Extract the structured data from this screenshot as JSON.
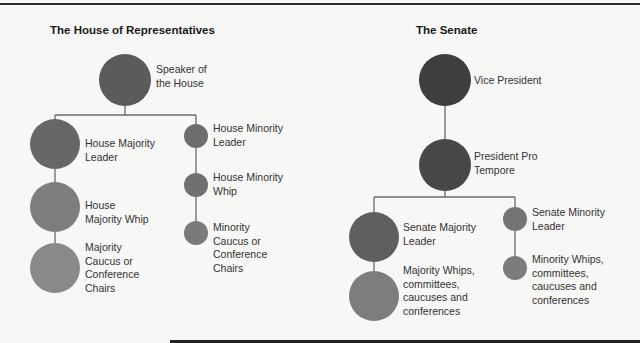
{
  "house": {
    "title": "The House of Representatives",
    "nodes": {
      "speaker": {
        "label_line1": "Speaker of",
        "label_line2": "the House",
        "color": "#5b5b5b"
      },
      "majority_leader": {
        "label_line1": "House Majority",
        "label_line2": "Leader",
        "color": "#676767"
      },
      "majority_whip": {
        "label_line1": "House",
        "label_line2": "Majority Whip",
        "color": "#7e7e7e"
      },
      "majority_caucus": {
        "label_line1": "Majority",
        "label_line2": "Caucus or",
        "label_line3": "Conference",
        "label_line4": "Chairs",
        "color": "#898989"
      },
      "minority_leader": {
        "label_line1": "House Minority",
        "label_line2": "Leader",
        "color": "#6e6e6e"
      },
      "minority_whip": {
        "label_line1": "House Minority",
        "label_line2": "Whip",
        "color": "#707070"
      },
      "minority_caucus": {
        "label_line1": "Minority",
        "label_line2": "Caucus or",
        "label_line3": "Conference",
        "label_line4": "Chairs",
        "color": "#7a7a7a"
      }
    }
  },
  "senate": {
    "title": "The Senate",
    "nodes": {
      "vice_president": {
        "label_line1": "Vice President",
        "color": "#3e3e3e"
      },
      "president_pro_tempore": {
        "label_line1": "President Pro",
        "label_line2": "Tempore",
        "color": "#484848"
      },
      "majority_leader": {
        "label_line1": "Senate Majority",
        "label_line2": "Leader",
        "color": "#5f5f5f"
      },
      "majority_whips": {
        "label_line1": "Majority Whips,",
        "label_line2": "committees,",
        "label_line3": "caucuses and",
        "label_line4": "conferences",
        "color": "#7d7d7d"
      },
      "minority_leader": {
        "label_line1": "Senate Minority",
        "label_line2": "Leader",
        "color": "#747474"
      },
      "minority_whips": {
        "label_line1": "Minority Whips,",
        "label_line2": "committees,",
        "label_line3": "caucuses and",
        "label_line4": "conferences",
        "color": "#7c7c7c"
      }
    }
  }
}
